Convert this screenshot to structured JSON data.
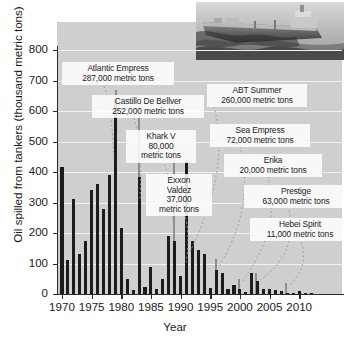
{
  "chart_data": {
    "type": "bar",
    "title": "",
    "xlabel": "Year",
    "ylabel": "Oil spilled from tankers (thousand metric tons)",
    "xlim": [
      1969,
      2012
    ],
    "ylim": [
      0,
      800
    ],
    "ytick_labels": [
      "0",
      "100",
      "200",
      "300",
      "400",
      "500",
      "600",
      "700",
      "800"
    ],
    "ytick_values": [
      0,
      100,
      200,
      300,
      400,
      500,
      600,
      700,
      800
    ],
    "xtick_labels": [
      "1970",
      "1975",
      "1980",
      "1985",
      "1990",
      "1995",
      "2000",
      "2005",
      "2010"
    ],
    "xtick_values": [
      1970,
      1975,
      1980,
      1985,
      1990,
      1995,
      2000,
      2005,
      2010
    ],
    "grid": "horizontal-white",
    "legend": "none",
    "bar_color": "#1c1c1c",
    "plot_background": "#cfcfcf",
    "x": [
      1970,
      1971,
      1972,
      1973,
      1974,
      1975,
      1976,
      1977,
      1978,
      1979,
      1980,
      1981,
      1982,
      1983,
      1984,
      1985,
      1986,
      1987,
      1988,
      1989,
      1990,
      1991,
      1992,
      1993,
      1994,
      1995,
      1996,
      1997,
      1998,
      1999,
      2000,
      2001,
      2002,
      2003,
      2004,
      2005,
      2006,
      2007,
      2008,
      2009,
      2010,
      2011,
      2012
    ],
    "values": [
      415,
      110,
      310,
      130,
      175,
      340,
      360,
      280,
      390,
      640,
      215,
      50,
      12,
      385,
      22,
      90,
      18,
      50,
      190,
      175,
      60,
      435,
      175,
      145,
      130,
      20,
      80,
      70,
      15,
      30,
      16,
      8,
      68,
      42,
      15,
      18,
      13,
      11,
      3,
      2,
      10,
      2,
      1
    ],
    "annotations": [
      {
        "name": "Atlantic Empress",
        "amount": "287,000 metric tons",
        "year": 1979
      },
      {
        "name": "Castillo De Bellver",
        "amount": "252,000 metric tons",
        "year": 1983
      },
      {
        "name": "Khark V",
        "amount": "80,000 metric tons",
        "year": 1989
      },
      {
        "name": "Exxon Valdez",
        "amount": "37,000 metric tons",
        "year": 1989
      },
      {
        "name": "ABT Summer",
        "amount": "260,000 metric tons",
        "year": 1991
      },
      {
        "name": "Sea Empress",
        "amount": "72,000 metric tons",
        "year": 1996
      },
      {
        "name": "Erika",
        "amount": "20,000 metric tons",
        "year": 1999
      },
      {
        "name": "Prestige",
        "amount": "63,000 metric tons",
        "year": 2002
      },
      {
        "name": "Hebei Spirit",
        "amount": "11,000 metric tons",
        "year": 2007
      }
    ]
  },
  "callouts": {
    "atlantic_empress": "Atlantic Empress\n287,000 metric tons",
    "castillo": "Castillo De Bellver\n252,000 metric tons",
    "khark": "Khark V\n80,000\nmetric tons",
    "exxon": "Exxon\nValdez\n37,000\nmetric tons",
    "abt": "ABT Summer\n260,000 metric tons",
    "sea_empress": "Sea Empress\n72,000 metric tons",
    "erika": "Erika\n20,000 metric tons",
    "prestige": "Prestige\n63,000 metric tons",
    "hebei": "Hebei Spirit\n11,000 metric tons"
  },
  "image": {
    "ship_photo_alt": "oil-tanker-photo"
  }
}
